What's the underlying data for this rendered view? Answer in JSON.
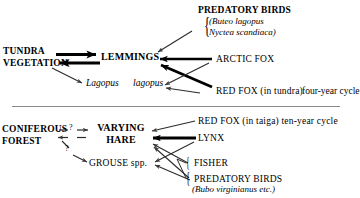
{
  "figure": {
    "type": "ecological-food-web-diagram",
    "panels": [
      {
        "id": "tundra",
        "nodes": {
          "habitat": "TUNDRA\nVEGETATION",
          "habitat_line1": "TUNDRA",
          "habitat_line2": "VEGETATION",
          "primary_consumer": "LEMMINGS",
          "secondary_prey_genus": "Lagopus",
          "secondary_prey_species": "lagopus",
          "predator_birds_title": "PREDATORY BIRDS",
          "predator_birds_species_1": "(Buteo lagopus",
          "predator_birds_species_2": "Nyctea scandiaca)",
          "predator_arctic_fox": "ARCTIC FOX",
          "predator_red_fox": "RED FOX (in tundra)",
          "cycle_note": "four-year cycle"
        }
      },
      {
        "id": "taiga",
        "nodes": {
          "habitat_line1": "CONIFEROUS",
          "habitat_line2": "FOREST",
          "primary_consumer_line1": "VARYING",
          "primary_consumer_line2": "HARE",
          "secondary_prey": "GROUSE spp.",
          "predator_red_fox": "RED FOX (in taiga) ten-year cycle",
          "predator_lynx": "LYNX",
          "predator_fisher": "FISHER",
          "predator_birds_title": "PREDATORY BIRDS",
          "predator_birds_species": "(Bubo virginianus etc.)",
          "uncertainty_mark_1": "?",
          "uncertainty_mark_2": "?"
        }
      }
    ],
    "glyphs": {
      "brace": "{",
      "question": "?"
    },
    "colors": {
      "ink": "#000000",
      "paper": "#ffffff",
      "rule": "#8a8a8a",
      "thin_arrow": "#3a3a3a"
    }
  }
}
